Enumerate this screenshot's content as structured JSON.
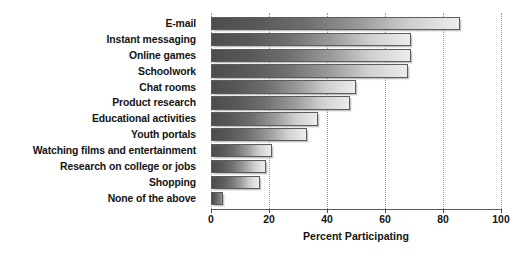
{
  "chart_data": {
    "type": "bar",
    "orientation": "horizontal",
    "title": "",
    "xlabel": "Percent Participating",
    "ylabel": "",
    "xlim": [
      0,
      100
    ],
    "xticks": [
      0,
      20,
      40,
      60,
      80,
      100
    ],
    "xtick_labels": [
      "0",
      "20",
      "40",
      "60",
      "80",
      "100"
    ],
    "grid": true,
    "grid_axis": "x",
    "legend": false,
    "categories": [
      "E-mail",
      "Instant messaging",
      "Online games",
      "Schoolwork",
      "Chat rooms",
      "Product research",
      "Educational activities",
      "Youth portals",
      "Watching films and entertainment",
      "Research on college or jobs",
      "Shopping",
      "None of the above"
    ],
    "values": [
      86,
      69,
      69,
      68,
      50,
      48,
      37,
      33,
      21,
      19,
      17,
      4
    ],
    "bar_color_start": "#4d4d4d",
    "bar_color_end": "#ececec",
    "bar_border_color": "#5c5c5c",
    "background_color": "#ffffff",
    "text_color": "#141414"
  }
}
